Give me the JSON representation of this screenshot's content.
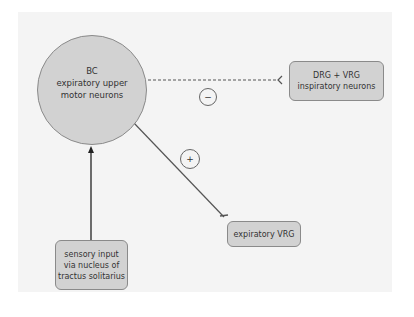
{
  "diagram": {
    "nodes": {
      "bc": {
        "line1": "BC",
        "line2": "expiratory upper",
        "line3": "motor neurons"
      },
      "drg_vrg": {
        "line1": "DRG + VRG",
        "line2": "inspiratory neurons"
      },
      "expiratory_vrg": {
        "line1": "expiratory VRG"
      },
      "sensory": {
        "line1": "sensory input",
        "line2": "via nucleus of",
        "line3": "tractus solitarius"
      }
    },
    "edges": [
      {
        "from": "drg_vrg",
        "to": "bc",
        "style": "dashed",
        "sign": "−",
        "label": "inhibitory"
      },
      {
        "from": "bc",
        "to": "expiratory_vrg",
        "style": "solid",
        "sign": "+",
        "label": "excitatory"
      },
      {
        "from": "sensory",
        "to": "bc",
        "style": "solid-arrow"
      }
    ],
    "signs": {
      "minus": "−",
      "plus": "+"
    },
    "colors": {
      "panel": "#f4f4f4",
      "node_fill": "#d2d2d2",
      "node_border": "#8a8a8a",
      "line": "#555555"
    }
  }
}
